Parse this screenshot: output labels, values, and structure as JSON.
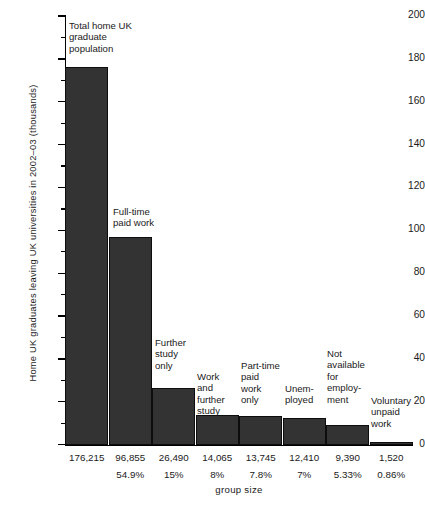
{
  "chart_data": {
    "type": "bar",
    "title": "",
    "xlabel": "group size",
    "ylabel": "Home UK graduates leaving UK universities in 2002–03 (thousands)",
    "ylim": [
      0,
      200
    ],
    "ytick_step": 20,
    "yminor_step": 10,
    "grid": false,
    "legend": "none",
    "ytick_labels": [
      "200",
      "180",
      "160",
      "140",
      "120",
      "100",
      "80",
      "60",
      "40",
      "20",
      "0"
    ],
    "categories": [
      "Total home UK\ngraduate\npopulation",
      "Full-time\npaid work",
      "Further\nstudy\nonly",
      "Work\nand\nfurther\nstudy",
      "Part-time\npaid\nwork\nonly",
      "Unem-\nployed",
      "Not\navailable\nfor\nemploy-\nment",
      "Voluntary\nunpaid\nwork"
    ],
    "values": [
      176.215,
      96.855,
      26.49,
      14.065,
      13.745,
      12.41,
      9.39,
      1.52
    ],
    "value_labels": [
      "176,215",
      "96,855",
      "26,490",
      "14,065",
      "13,745",
      "12,410",
      "9,390",
      "1,520"
    ],
    "percent_labels": [
      "",
      "54.9%",
      "15%",
      "8%",
      "7.8%",
      "7%",
      "5.33%",
      "0.86%"
    ],
    "bar_color": "#333333",
    "axis_color": "#000000",
    "background_color": "#ffffff"
  }
}
